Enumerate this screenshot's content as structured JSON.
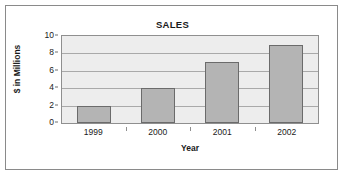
{
  "chart_data": {
    "type": "bar",
    "title": "SALES",
    "xlabel": "Year",
    "ylabel": "$ in Millions",
    "categories": [
      "1999",
      "2000",
      "2001",
      "2002"
    ],
    "values": [
      2,
      4,
      7,
      9
    ],
    "yticks": [
      "10",
      "8",
      "6",
      "4",
      "2",
      "0"
    ],
    "ylim": [
      0,
      10
    ],
    "grid": "horizontal",
    "legend": "none",
    "colors": {
      "bar_fill": "#b4b4b4",
      "bar_border": "#6b6b6b",
      "plot_background": "#ededed",
      "gridline": "#a9a9a9",
      "frame_border": "#8a8a8a",
      "text": "#1a1a1a"
    }
  }
}
